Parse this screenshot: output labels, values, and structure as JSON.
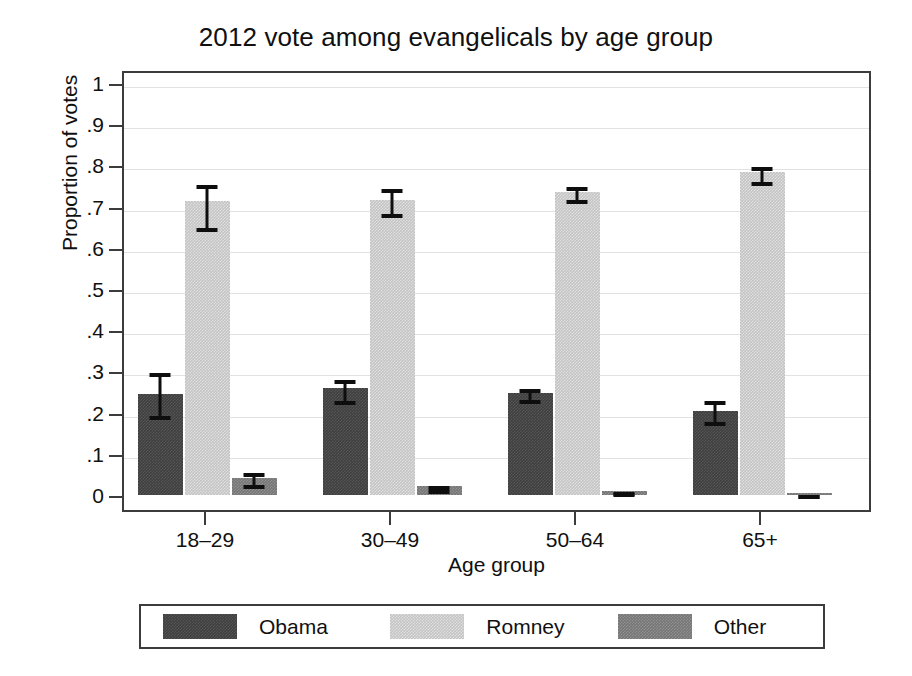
{
  "chart_data": {
    "type": "bar",
    "title": "2012 vote among evangelicals by age group",
    "xlabel": "Age group",
    "ylabel": "Proportion of votes",
    "categories": [
      "18–29",
      "30–49",
      "50–64",
      "65+"
    ],
    "ylim": [
      0,
      1
    ],
    "yticks": [
      0,
      0.1,
      0.2,
      0.3,
      0.4,
      0.5,
      0.6,
      0.7,
      0.8,
      0.9,
      1
    ],
    "ytick_labels": [
      "0",
      ".1",
      ".2",
      ".3",
      ".4",
      ".5",
      ".6",
      ".7",
      ".8",
      ".9",
      "1"
    ],
    "grid": true,
    "grid_axis": "y",
    "legend_position": "bottom",
    "errorbars": "95% confidence interval",
    "series": [
      {
        "name": "Obama",
        "color": "#3f3f3f",
        "values": [
          0.245,
          0.259,
          0.248,
          0.205
        ],
        "ci_low": [
          0.191,
          0.228,
          0.23,
          0.177
        ],
        "ci_high": [
          0.305,
          0.288,
          0.268,
          0.237
        ]
      },
      {
        "name": "Romney",
        "color": "#c3c3c3",
        "values": [
          0.714,
          0.715,
          0.735,
          0.783
        ],
        "ci_low": [
          0.648,
          0.683,
          0.716,
          0.76
        ],
        "ci_high": [
          0.762,
          0.752,
          0.757,
          0.806
        ]
      },
      {
        "name": "Other",
        "color": "#757575",
        "values": [
          0.041,
          0.021,
          0.01,
          0.005
        ],
        "ci_low": [
          0.025,
          0.013,
          0.006,
          0.003
        ],
        "ci_high": [
          0.062,
          0.032,
          0.016,
          0.009
        ]
      }
    ]
  },
  "legend": {
    "entries": [
      {
        "label": "Obama",
        "color": "#3f3f3f"
      },
      {
        "label": "Romney",
        "color": "#c3c3c3"
      },
      {
        "label": "Other",
        "color": "#757575"
      }
    ]
  }
}
